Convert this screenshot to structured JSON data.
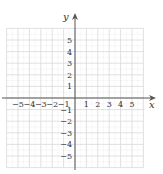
{
  "graph": {
    "x_axis_label": "x",
    "y_axis_label": "y",
    "x_range": [
      -6,
      6
    ],
    "y_range": [
      -6,
      6
    ],
    "x_tick_labels": [
      "−5",
      "−4",
      "−3",
      "−2",
      "−1",
      "1",
      "2",
      "3",
      "4",
      "5"
    ],
    "y_tick_labels": [
      "5",
      "4",
      "3",
      "2",
      "1",
      "−1",
      "−2",
      "−3",
      "−4",
      "−5"
    ],
    "grid_color": "#d9d9d9",
    "axis_color": "#555555"
  }
}
